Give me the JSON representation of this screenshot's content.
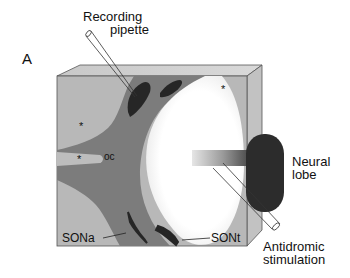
{
  "figure": {
    "panel_label": "A",
    "labels": {
      "recording_line1": "Recording",
      "recording_line2": "pipette",
      "neural_line1": "Neural",
      "neural_line2": "lobe",
      "antidromic_line1": "Antidromic",
      "antidromic_line2": "stimulation",
      "sona": "SONa",
      "sont": "SONt",
      "oc": "oc",
      "star": "*"
    },
    "colors": {
      "block_light": "#b9b9b9",
      "block_top": "#d4d4d4",
      "block_side": "#c6c6c6",
      "tissue_mid": "#7f7f7f",
      "nucleus_dark": "#2a2a2a",
      "neural_lobe": "#2e2e2e",
      "cavity": "#ffffff",
      "outline": "#444444"
    }
  }
}
